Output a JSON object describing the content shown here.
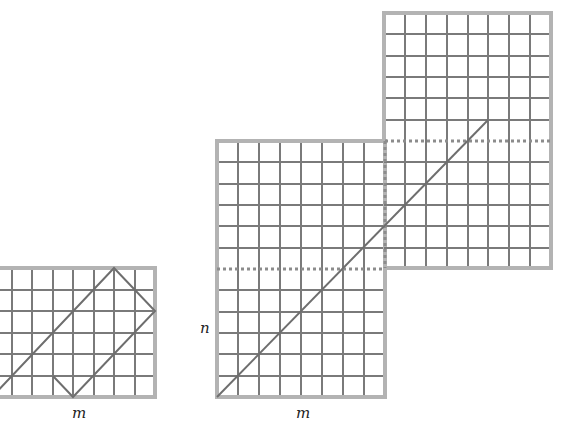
{
  "figure": {
    "colors": {
      "grid_line": "#7a7a7a",
      "border": "#b3b3b3",
      "diagonal": "#6e6e6e",
      "dashed": "#8c8c8c"
    }
  },
  "left_panel": {
    "label_m": "m",
    "cols_visible": 8,
    "rows": 6
  },
  "right_panel": {
    "label_m": "m",
    "label_n": "n",
    "lower_block": {
      "cols": 8,
      "rows": 12
    },
    "upper_block": {
      "cols": 8,
      "rows": 12
    }
  }
}
